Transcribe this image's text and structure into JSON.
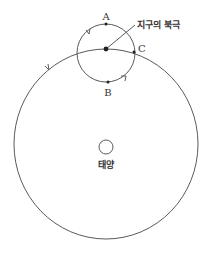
{
  "diagram": {
    "title": "",
    "labels": {
      "point_a": "A",
      "point_b": "B",
      "point_c": "C",
      "north_pole": "지구의 북극",
      "sun": "태양"
    },
    "colors": {
      "stroke": "#5a5a5a",
      "text": "#333333",
      "background": "#ffffff"
    },
    "elements": {
      "orbit": {
        "shape": "circle",
        "description": "large orbit circle with counterclockwise arrow"
      },
      "rotation_circle": {
        "shape": "circle",
        "description": "small circle around Earth's north pole with counterclockwise arrows"
      },
      "sun": {
        "shape": "circle",
        "description": "small circle at center of orbit"
      },
      "points": [
        "A",
        "B",
        "C",
        "north-pole"
      ]
    }
  }
}
